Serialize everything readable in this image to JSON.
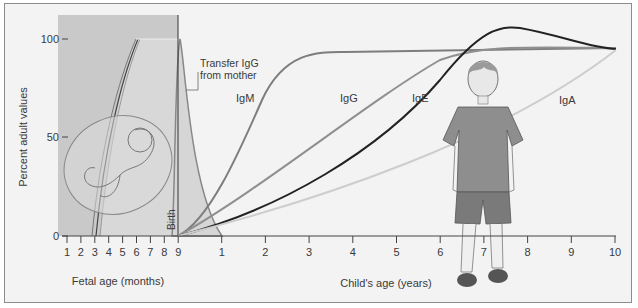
{
  "chart_data": {
    "type": "line",
    "title": "",
    "ylabel": "Percent adult values",
    "ylim": [
      0,
      100
    ],
    "y_ticks": [
      0,
      50,
      100
    ],
    "x_axes": [
      {
        "label": "Fetal age (months)",
        "ticks": [
          "1",
          "2",
          "3",
          "4",
          "5",
          "6",
          "7",
          "8",
          "9"
        ]
      },
      {
        "label": "Child's age (years)",
        "ticks": [
          "1",
          "2",
          "3",
          "4",
          "5",
          "6",
          "7",
          "8",
          "9",
          "10"
        ]
      }
    ],
    "annotations": {
      "birth": "Birth",
      "transfer": [
        "Transfer IgG",
        "from mother"
      ]
    },
    "x_child_years": [
      0,
      0.5,
      1,
      1.5,
      2,
      2.5,
      3,
      4,
      5,
      6,
      7,
      8,
      9,
      10
    ],
    "series": [
      {
        "name": "IgM",
        "color": "#7d7d7d",
        "values": [
          0,
          12,
          30,
          55,
          72,
          86,
          93,
          94,
          94,
          95,
          95,
          95,
          95,
          95
        ]
      },
      {
        "name": "IgG",
        "color": "#8f8f8f",
        "values": [
          0,
          6,
          13,
          20,
          28,
          36,
          44,
          60,
          76,
          91,
          94,
          94,
          94,
          94
        ]
      },
      {
        "name": "IgE",
        "color": "#222222",
        "values": [
          0,
          3,
          7,
          11,
          16,
          22,
          28,
          43,
          62,
          90,
          106,
          104,
          99,
          95
        ]
      },
      {
        "name": "IgA",
        "color": "#c8c8c8",
        "values": [
          0,
          1,
          3,
          5,
          8,
          10,
          13,
          21,
          31,
          44,
          58,
          72,
          84,
          95
        ]
      },
      {
        "name": "Transfer IgG from mother",
        "color": "#888888",
        "x_label": "fetal month 9 peak, decays by year 1",
        "peak": 100
      }
    ],
    "legend": "inline labels"
  }
}
